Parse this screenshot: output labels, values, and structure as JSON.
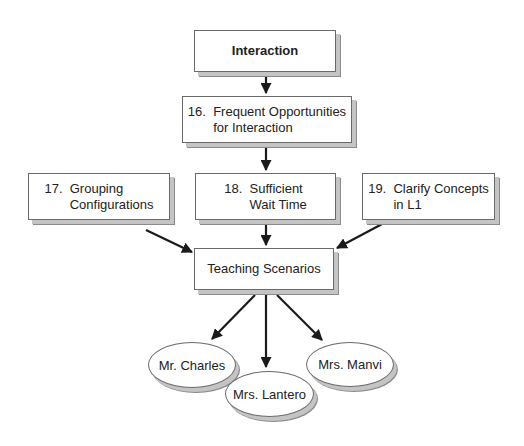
{
  "diagram": {
    "title_node": {
      "label": "Interaction"
    },
    "nodes": [
      {
        "id": "n16",
        "label": "16.  Frequent Opportunities\n       for Interaction"
      },
      {
        "id": "n17",
        "label": "17.  Grouping\n       Configurations"
      },
      {
        "id": "n18",
        "label": "18.  Sufficient\n       Wait Time"
      },
      {
        "id": "n19",
        "label": "19.  Clarify Concepts\n       in L1"
      },
      {
        "id": "scenarios",
        "label": "Teaching Scenarios"
      }
    ],
    "teachers": [
      {
        "label": "Mr. Charles"
      },
      {
        "label": "Mrs. Lantero"
      },
      {
        "label": "Mrs. Manvi"
      }
    ],
    "edges": [
      [
        "Interaction",
        "16"
      ],
      [
        "16",
        "18"
      ],
      [
        "17",
        "Teaching Scenarios"
      ],
      [
        "18",
        "Teaching Scenarios"
      ],
      [
        "19",
        "Teaching Scenarios"
      ],
      [
        "Teaching Scenarios",
        "Mr. Charles"
      ],
      [
        "Teaching Scenarios",
        "Mrs. Lantero"
      ],
      [
        "Teaching Scenarios",
        "Mrs. Manvi"
      ]
    ],
    "colors": {
      "border": "#6a6a6a",
      "shadow_light": "#c4c4c4",
      "shadow_dark": "#8a8a8a",
      "arrow": "#1a1a1a"
    }
  }
}
